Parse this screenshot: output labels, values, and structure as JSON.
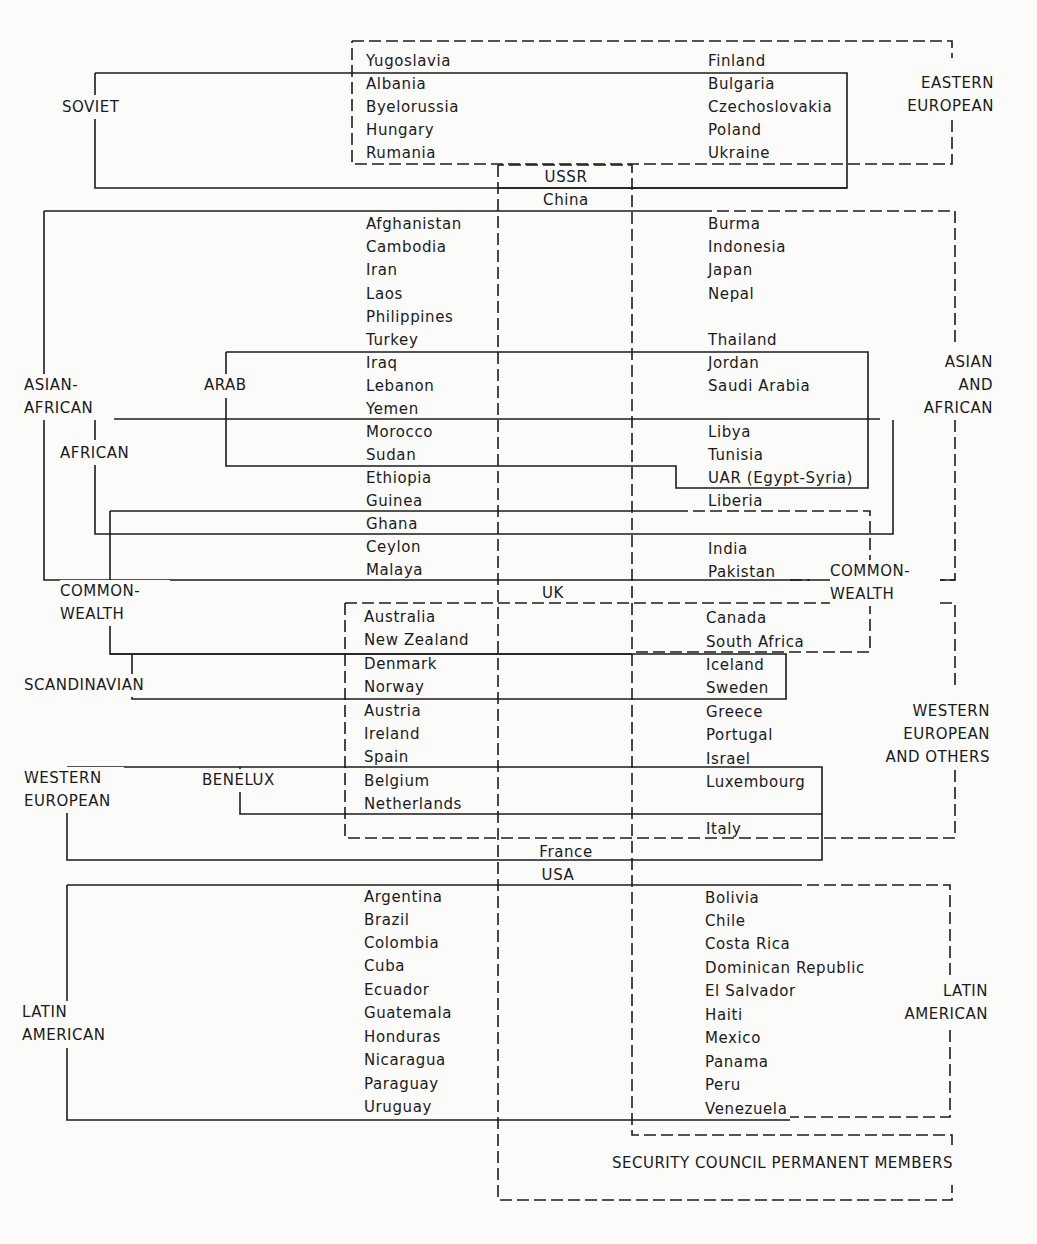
{
  "diagram": {
    "line_color": "#1c1c1c",
    "background": "#fbfbfa",
    "left_column": [
      {
        "name": "Yugoslavia",
        "x": 366,
        "y": 61
      },
      {
        "name": "Albania",
        "x": 366,
        "y": 84
      },
      {
        "name": "Byelorussia",
        "x": 366,
        "y": 107
      },
      {
        "name": "Hungary",
        "x": 366,
        "y": 130
      },
      {
        "name": "Rumania",
        "x": 366,
        "y": 153
      },
      {
        "name": "Afghanistan",
        "x": 366,
        "y": 224
      },
      {
        "name": "Cambodia",
        "x": 366,
        "y": 247
      },
      {
        "name": "Iran",
        "x": 366,
        "y": 270
      },
      {
        "name": "Laos",
        "x": 366,
        "y": 294
      },
      {
        "name": "Philippines",
        "x": 366,
        "y": 317
      },
      {
        "name": "Turkey",
        "x": 366,
        "y": 340
      },
      {
        "name": "Iraq",
        "x": 366,
        "y": 363
      },
      {
        "name": "Lebanon",
        "x": 366,
        "y": 386
      },
      {
        "name": "Yemen",
        "x": 366,
        "y": 409
      },
      {
        "name": "Morocco",
        "x": 366,
        "y": 432
      },
      {
        "name": "Sudan",
        "x": 366,
        "y": 455
      },
      {
        "name": "Ethiopia",
        "x": 366,
        "y": 478
      },
      {
        "name": "Guinea",
        "x": 366,
        "y": 501
      },
      {
        "name": "Ghana",
        "x": 366,
        "y": 524
      },
      {
        "name": "Ceylon",
        "x": 366,
        "y": 547
      },
      {
        "name": "Malaya",
        "x": 366,
        "y": 570
      },
      {
        "name": "Australia",
        "x": 364,
        "y": 617
      },
      {
        "name": "New Zealand",
        "x": 364,
        "y": 640
      },
      {
        "name": "Denmark",
        "x": 364,
        "y": 664
      },
      {
        "name": "Norway",
        "x": 364,
        "y": 687
      },
      {
        "name": "Austria",
        "x": 364,
        "y": 711
      },
      {
        "name": "Ireland",
        "x": 364,
        "y": 734
      },
      {
        "name": "Spain",
        "x": 364,
        "y": 757
      },
      {
        "name": "Belgium",
        "x": 364,
        "y": 781
      },
      {
        "name": "Netherlands",
        "x": 364,
        "y": 804
      },
      {
        "name": "Argentina",
        "x": 364,
        "y": 897
      },
      {
        "name": "Brazil",
        "x": 364,
        "y": 920
      },
      {
        "name": "Colombia",
        "x": 364,
        "y": 943
      },
      {
        "name": "Cuba",
        "x": 364,
        "y": 966
      },
      {
        "name": "Ecuador",
        "x": 364,
        "y": 990
      },
      {
        "name": "Guatemala",
        "x": 364,
        "y": 1013
      },
      {
        "name": "Honduras",
        "x": 364,
        "y": 1037
      },
      {
        "name": "Nicaragua",
        "x": 364,
        "y": 1060
      },
      {
        "name": "Paraguay",
        "x": 364,
        "y": 1084
      },
      {
        "name": "Uruguay",
        "x": 364,
        "y": 1107
      }
    ],
    "right_column": [
      {
        "name": "Finland",
        "x": 708,
        "y": 61
      },
      {
        "name": "Bulgaria",
        "x": 708,
        "y": 84
      },
      {
        "name": "Czechoslovakia",
        "x": 708,
        "y": 107
      },
      {
        "name": "Poland",
        "x": 708,
        "y": 130
      },
      {
        "name": "Ukraine",
        "x": 708,
        "y": 153
      },
      {
        "name": "Burma",
        "x": 708,
        "y": 224
      },
      {
        "name": "Indonesia",
        "x": 708,
        "y": 247
      },
      {
        "name": "Japan",
        "x": 708,
        "y": 270
      },
      {
        "name": "Nepal",
        "x": 708,
        "y": 294
      },
      {
        "name": "Thailand",
        "x": 708,
        "y": 340
      },
      {
        "name": "Jordan",
        "x": 708,
        "y": 363
      },
      {
        "name": "Saudi Arabia",
        "x": 708,
        "y": 386
      },
      {
        "name": "Libya",
        "x": 708,
        "y": 432
      },
      {
        "name": "Tunisia",
        "x": 708,
        "y": 455
      },
      {
        "name": "UAR (Egypt-Syria)",
        "x": 708,
        "y": 478
      },
      {
        "name": "Liberia",
        "x": 708,
        "y": 501
      },
      {
        "name": "India",
        "x": 708,
        "y": 549
      },
      {
        "name": "Pakistan",
        "x": 708,
        "y": 572
      },
      {
        "name": "Canada",
        "x": 706,
        "y": 618
      },
      {
        "name": "South Africa",
        "x": 706,
        "y": 642
      },
      {
        "name": "Iceland",
        "x": 706,
        "y": 665
      },
      {
        "name": "Sweden",
        "x": 706,
        "y": 688
      },
      {
        "name": "Greece",
        "x": 706,
        "y": 712
      },
      {
        "name": "Portugal",
        "x": 706,
        "y": 735
      },
      {
        "name": "Israel",
        "x": 706,
        "y": 759
      },
      {
        "name": "Luxembourg",
        "x": 706,
        "y": 782
      },
      {
        "name": "Italy",
        "x": 706,
        "y": 829
      },
      {
        "name": "Bolivia",
        "x": 705,
        "y": 898
      },
      {
        "name": "Chile",
        "x": 705,
        "y": 921
      },
      {
        "name": "Costa Rica",
        "x": 705,
        "y": 944
      },
      {
        "name": "Dominican Republic",
        "x": 705,
        "y": 968
      },
      {
        "name": "El Salvador",
        "x": 705,
        "y": 991
      },
      {
        "name": "Haiti",
        "x": 705,
        "y": 1015
      },
      {
        "name": "Mexico",
        "x": 705,
        "y": 1038
      },
      {
        "name": "Panama",
        "x": 705,
        "y": 1062
      },
      {
        "name": "Peru",
        "x": 705,
        "y": 1085
      },
      {
        "name": "Venezuela",
        "x": 705,
        "y": 1109
      }
    ],
    "permanent_members": [
      {
        "name": "USSR",
        "x": 566,
        "y": 177
      },
      {
        "name": "China",
        "x": 566,
        "y": 200
      },
      {
        "name": "UK",
        "x": 553,
        "y": 593
      },
      {
        "name": "France",
        "x": 566,
        "y": 852
      },
      {
        "name": "USA",
        "x": 558,
        "y": 875
      }
    ],
    "group_labels": [
      {
        "id": "soviet",
        "lines": [
          "SOVIET"
        ],
        "x": 62,
        "y": 96,
        "align": "left",
        "width": 80,
        "style": "solid"
      },
      {
        "id": "eastern-european",
        "lines": [
          "EASTERN",
          "EUROPEAN"
        ],
        "x": 880,
        "y": 72,
        "align": "right",
        "width": 114,
        "style": "dashed"
      },
      {
        "id": "asian-african-bloc",
        "lines": [
          "ASIAN-",
          "AFRICAN"
        ],
        "x": 24,
        "y": 374,
        "align": "left",
        "width": 90,
        "style": "solid"
      },
      {
        "id": "arab",
        "lines": [
          "ARAB"
        ],
        "x": 204,
        "y": 374,
        "align": "left",
        "width": 60,
        "style": "solid"
      },
      {
        "id": "african",
        "lines": [
          "AFRICAN"
        ],
        "x": 60,
        "y": 442,
        "align": "left",
        "width": 90,
        "style": "solid"
      },
      {
        "id": "asian-and-african-group",
        "lines": [
          "ASIAN",
          "AND",
          "AFRICAN"
        ],
        "x": 880,
        "y": 351,
        "align": "right",
        "width": 113,
        "style": "dashed"
      },
      {
        "id": "commonwealth-bloc",
        "lines": [
          "COMMON-",
          "WEALTH"
        ],
        "x": 60,
        "y": 580,
        "align": "left",
        "width": 110,
        "style": "solid"
      },
      {
        "id": "commonwealth-group",
        "lines": [
          "COMMON-",
          "WEALTH"
        ],
        "x": 830,
        "y": 560,
        "align": "left",
        "width": 110,
        "style": "dashed"
      },
      {
        "id": "scandinavian",
        "lines": [
          "SCANDINAVIAN"
        ],
        "x": 24,
        "y": 674,
        "align": "left",
        "width": 150,
        "style": "solid"
      },
      {
        "id": "western-european-and-others",
        "lines": [
          "WESTERN",
          "EUROPEAN",
          "AND OTHERS"
        ],
        "x": 860,
        "y": 700,
        "align": "right",
        "width": 130,
        "style": "dashed"
      },
      {
        "id": "western-european-bloc",
        "lines": [
          "WESTERN",
          "EUROPEAN"
        ],
        "x": 24,
        "y": 767,
        "align": "left",
        "width": 100,
        "style": "solid"
      },
      {
        "id": "benelux",
        "lines": [
          "BENELUX"
        ],
        "x": 202,
        "y": 769,
        "align": "left",
        "width": 80,
        "style": "solid"
      },
      {
        "id": "latin-american-bloc",
        "lines": [
          "LATIN",
          "AMERICAN"
        ],
        "x": 22,
        "y": 1001,
        "align": "left",
        "width": 100,
        "style": "solid"
      },
      {
        "id": "latin-american-group",
        "lines": [
          "LATIN",
          "AMERICAN"
        ],
        "x": 880,
        "y": 980,
        "align": "right",
        "width": 108,
        "style": "dashed"
      },
      {
        "id": "security-council",
        "lines": [
          "SECURITY COUNCIL PERMANENT MEMBERS"
        ],
        "x": 612,
        "y": 1152,
        "align": "left",
        "width": 380,
        "style": "dashed"
      }
    ],
    "solid_lines": [
      "M95 73 H847 V188 H95 V115 M95 73 V95",
      "M44 211 H498 M44 211 V375 M44 418 V580 H955",
      "M226 352 H868 V488 H676 V466 H226 V398 M226 352 V374",
      "M95 419 H893 V534 H95 V464 M95 419 V440",
      "M110 511 H676 M110 511 V580 M110 602 V654 H498 M632 654 H498",
      "M110 654 H786 V699 H132 V654",
      "M67 767 H822 V860 H67 V813 M67 767 V767",
      "M240 767 V814 H822",
      "M67 885 H498",
      "M67 885 V1002 M67 1048 V1120 H790",
      "M498 885 H790",
      "M498 188 H632",
      "M498 211 H632 M632 211 H700",
      "M632 188 H847"
    ],
    "dashed_lines": [
      "M352 41 H952 V58 M952 120 V164 H352 V41",
      "M700 211 H955 V345 M955 420 V580 H930",
      "M790 580 H810",
      "M676 511 H870 V560 M870 602 V652 H632",
      "M345 603 H955 V690 M955 770 V838 H345 V603",
      "M498 165 V1200 H952 V1185 M952 1145 V1135 H632 V165 H498",
      "M790 885 H950 V980 M950 1030 V1117 H790"
    ]
  }
}
